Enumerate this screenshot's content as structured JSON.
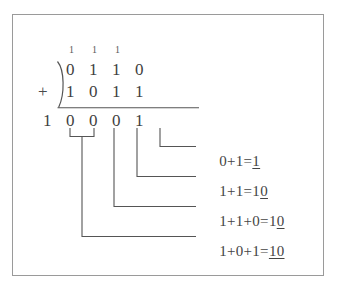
{
  "figure": {
    "kind": "binary-addition-worked-example",
    "frame_color": "#9a9a9a",
    "ink_color": "#444444"
  },
  "problem": {
    "operator": "+",
    "carries": [
      "1",
      "1",
      "1"
    ],
    "addend_top": [
      "0",
      "1",
      "1",
      "0"
    ],
    "addend_bottom": [
      "1",
      "0",
      "1",
      "1"
    ],
    "sum": [
      "1",
      "0",
      "0",
      "0",
      "1"
    ]
  },
  "annotations": [
    {
      "id": "ann-ones",
      "column": "ones",
      "text_plain": "0+1=1",
      "lhs": "0+1=",
      "result_plain": "1",
      "result_prefix": "",
      "result_underlined": "1"
    },
    {
      "id": "ann-twos",
      "column": "twos",
      "text_plain": "1+1=10",
      "lhs": "1+1=",
      "result_plain": "10",
      "result_prefix": "1",
      "result_underlined": "0"
    },
    {
      "id": "ann-fours",
      "column": "fours",
      "text_plain": "1+1+0=10",
      "lhs": "1+1+0=",
      "result_plain": "10",
      "result_prefix": "1",
      "result_underlined": "0"
    },
    {
      "id": "ann-eights",
      "column": "eights",
      "text_plain": "1+0+1=10",
      "lhs": "1+0+1=",
      "result_plain": "10",
      "result_prefix": "",
      "result_underlined": "10"
    }
  ]
}
